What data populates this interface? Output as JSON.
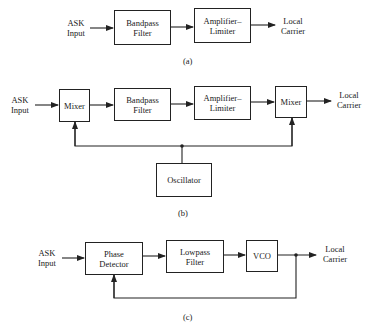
{
  "diagram_a": {
    "caption": "(a)",
    "input_label_1": "ASK",
    "input_label_2": "Input",
    "blocks": [
      {
        "id": "bandpass-filter",
        "line1": "Bandpass",
        "line2": "Filter"
      },
      {
        "id": "amplifier-limiter",
        "line1": "Amplifier–",
        "line2": "Limiter"
      }
    ],
    "output_label_1": "Local",
    "output_label_2": "Carrier"
  },
  "diagram_b": {
    "caption": "(b)",
    "input_label_1": "ASK",
    "input_label_2": "Input",
    "blocks": [
      {
        "id": "mixer-1",
        "line1": "Mixer"
      },
      {
        "id": "bandpass-filter",
        "line1": "Bandpass",
        "line2": "Filter"
      },
      {
        "id": "amplifier-limiter",
        "line1": "Amplifier–",
        "line2": "Limiter"
      },
      {
        "id": "mixer-2",
        "line1": "Mixer"
      },
      {
        "id": "oscillator",
        "line1": "Oscillator"
      }
    ],
    "output_label_1": "Local",
    "output_label_2": "Carrier"
  },
  "diagram_c": {
    "caption": "(c)",
    "input_label_1": "ASK",
    "input_label_2": "Input",
    "blocks": [
      {
        "id": "phase-detector",
        "line1": "Phase",
        "line2": "Detector"
      },
      {
        "id": "lowpass-filter",
        "line1": "Lowpass",
        "line2": "Filter"
      },
      {
        "id": "vco",
        "line1": "VCO"
      }
    ],
    "output_label_1": "Local",
    "output_label_2": "Carrier"
  }
}
